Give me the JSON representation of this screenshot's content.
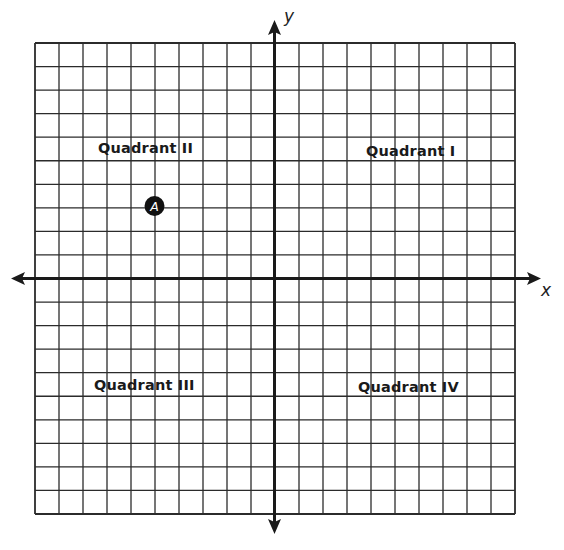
{
  "diagram": {
    "type": "coordinate-plane",
    "grid": {
      "columns": 20,
      "rows": 20,
      "x_range": [
        -10,
        10
      ],
      "y_range": [
        -10,
        10
      ],
      "line_color": "#2b2b2b",
      "axis_color": "#1a1a1a"
    },
    "axes": {
      "x_label": "x",
      "y_label": "y"
    },
    "quadrants": [
      {
        "id": "I",
        "label": "Quadrant I"
      },
      {
        "id": "II",
        "label": "Quadrant II"
      },
      {
        "id": "III",
        "label": "Quadrant III"
      },
      {
        "id": "IV",
        "label": "Quadrant IV"
      }
    ],
    "points": [
      {
        "label": "A",
        "x": -5,
        "y": 3,
        "fill": "#111111",
        "text_color": "#ffffff"
      }
    ]
  }
}
